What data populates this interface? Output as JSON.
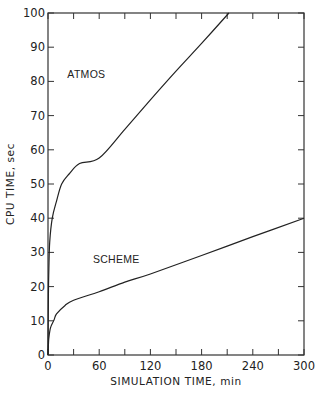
{
  "chart_data": {
    "type": "line",
    "title": "",
    "xlabel": "SIMULATION TIME, min",
    "ylabel": "CPU TIME, sec",
    "xlim": [
      0,
      300
    ],
    "ylim": [
      0,
      100
    ],
    "x_ticks": [
      0,
      60,
      120,
      180,
      240,
      300
    ],
    "x_minor_step": 30,
    "y_ticks": [
      0,
      10,
      20,
      30,
      40,
      50,
      60,
      70,
      80,
      90,
      100
    ],
    "grid": false,
    "legend": "inline labels",
    "series": [
      {
        "name": "ATMOS",
        "label_pos": [
          45,
          81
        ],
        "x": [
          0,
          0.5,
          1,
          2,
          5,
          10,
          16,
          25,
          37,
          60,
          90,
          120,
          150,
          180,
          212
        ],
        "values": [
          0,
          18,
          25,
          33,
          40,
          45,
          50,
          53,
          56,
          57.6,
          66,
          74.6,
          83,
          91.1,
          100
        ]
      },
      {
        "name": "SCHEME",
        "label_pos": [
          80,
          27
        ],
        "x": [
          0,
          0.5,
          1,
          3,
          7,
          10,
          20,
          30,
          60,
          90,
          120,
          180,
          240,
          300
        ],
        "values": [
          0,
          3,
          5,
          8,
          10.2,
          12,
          14.5,
          16,
          18.5,
          21.3,
          23.7,
          29.1,
          34.6,
          40
        ]
      }
    ],
    "colors": {
      "line": "#222222",
      "axis": "#333333"
    }
  }
}
